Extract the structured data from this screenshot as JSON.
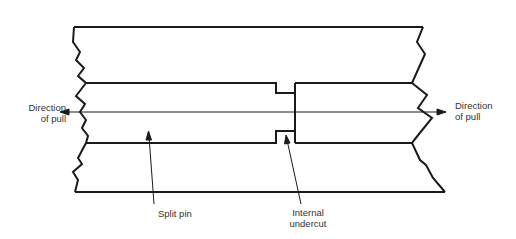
{
  "diagram": {
    "labels": {
      "direction_left_line1": "Direction",
      "direction_left_line2": "of pull",
      "direction_right_line1": "Direction",
      "direction_right_line2": "of pull",
      "split_pin": "Split pin",
      "undercut_line1": "Internal",
      "undercut_line2": "undercut"
    },
    "colors": {
      "line": "#1a1a1a",
      "background": "#ffffff",
      "text": "#333333"
    }
  }
}
